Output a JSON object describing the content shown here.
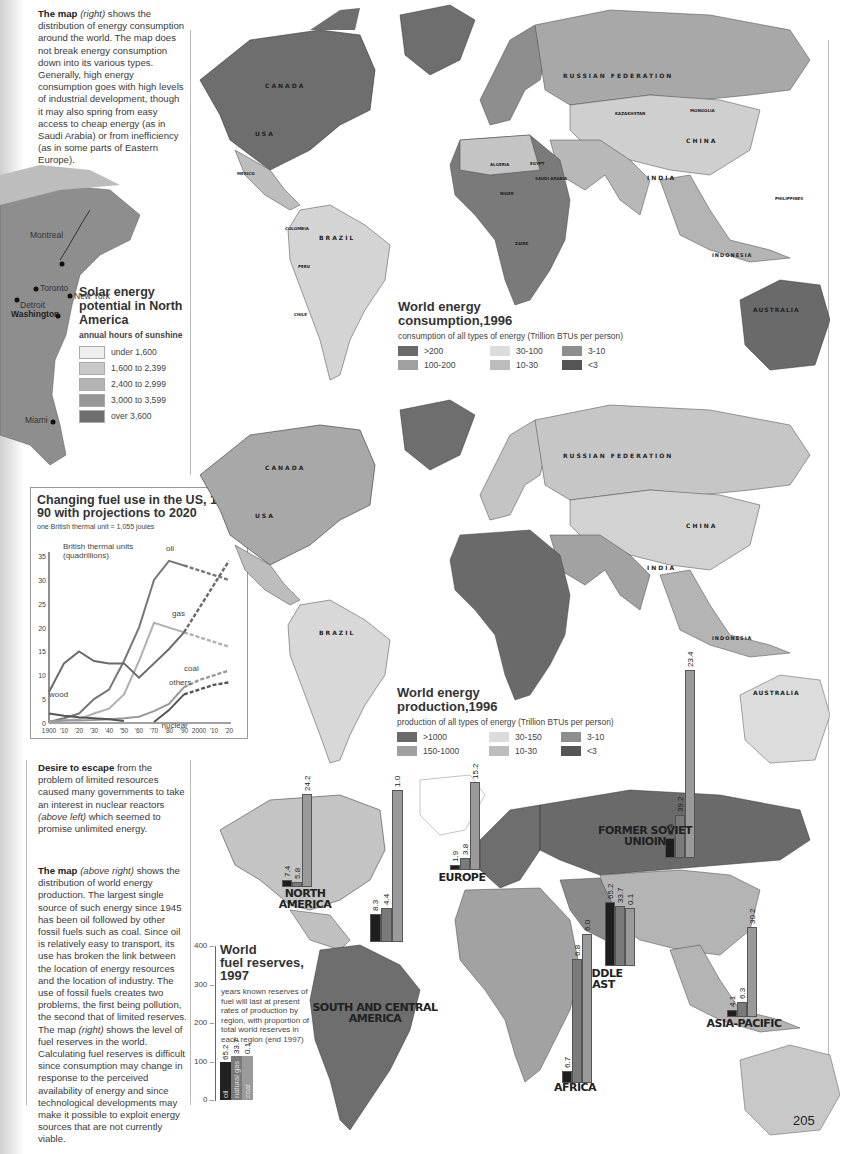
{
  "intro_text": {
    "lead": "The map",
    "lead_italic": "(right)",
    "body": "shows the distribution of energy consumption around the world. The map does not break energy consumption down into its various types. Generally, high energy consumption goes with high levels of industrial development, though it may also spring from easy access to cheap energy (as in Saudi Arabia) or from inefficiency (as in some parts of Eastern Europe)."
  },
  "solar_map": {
    "title": "Solar energy potential in North America",
    "subtitle": "annual hours of sunshine",
    "cities": [
      "Montreal",
      "Toronto",
      "New York",
      "Detroit",
      "Washington",
      "Miami"
    ],
    "legend": [
      {
        "label": "under 1,600",
        "color": "#eeeeee"
      },
      {
        "label": "1,600 to 2,399",
        "color": "#c8c8c8"
      },
      {
        "label": "2,400 to 2,999",
        "color": "#b4b4b4"
      },
      {
        "label": "3,000 to 3,599",
        "color": "#969696"
      },
      {
        "label": "over 3,600",
        "color": "#6e6e6e"
      }
    ]
  },
  "consumption_map": {
    "title_line1": "World energy",
    "title_line2": "consumption,1996",
    "subtitle": "consumption of all types of energy (Trillion BTUs per person)",
    "legend": [
      {
        "label": ">200",
        "color": "#6a6a6a"
      },
      {
        "label": "100-200",
        "color": "#a0a0a0"
      },
      {
        "label": "30-100",
        "color": "#dcdcdc"
      },
      {
        "label": "10-30",
        "color": "#bdbdbd"
      },
      {
        "label": "3-10",
        "color": "#8e8e8e"
      },
      {
        "label": "<3",
        "color": "#555555"
      }
    ],
    "country_labels": [
      "CANADA",
      "USA",
      "MEXICO",
      "VENEZUELA",
      "COLOMBIA",
      "PERU",
      "BRAZIL",
      "BOLIVIA",
      "PARAGUAY",
      "CHILE",
      "ARGENTINA",
      "RUSSIAN FEDERATION",
      "KAZAKHSTAN",
      "MONGOLIA",
      "CHINA",
      "FRANCE",
      "SPAIN",
      "TURKEY",
      "IRAN",
      "INDIA",
      "ALGERIA",
      "LIBYA",
      "EGYPT",
      "SAUDI ARABIA",
      "MALI",
      "NIGER",
      "CHAD",
      "SUDAN",
      "ETHIOPIA",
      "SOMALIA",
      "C.A.R.",
      "ZAIRE",
      "TANZANIA",
      "NAMIBIA",
      "SOUTH AFRICA",
      "PHILIPPINES",
      "MALAYSIA",
      "INDONESIA",
      "AUSTRALIA"
    ]
  },
  "fuel_chart": {
    "title": "Changing fuel use in the US, 1900-90 with projections to 2020",
    "subtitle": "one British thermal unit = 1,055 joules"
  },
  "chart_data": {
    "type": "line",
    "title": "Changing fuel use in the US, 1900-90 with projections to 2020",
    "subtitle": "one British thermal unit = 1,055 joules",
    "ylabel": "British thermal units (quadrillions)",
    "xlabel": "",
    "ylim": [
      0,
      35
    ],
    "yticks": [
      0,
      5,
      10,
      15,
      20,
      25,
      30,
      35
    ],
    "xticks": [
      "1900",
      "'10",
      "'20",
      "'30",
      "'40",
      "'50",
      "'60",
      "'70",
      "'80",
      "'90",
      "2000",
      "'10",
      "'20"
    ],
    "x": [
      1900,
      1910,
      1920,
      1930,
      1940,
      1950,
      1960,
      1970,
      1980,
      1990,
      2000,
      2010,
      2020
    ],
    "projection_start": 1990,
    "series": [
      {
        "name": "oil",
        "values": [
          0.2,
          1,
          2,
          5,
          7,
          13,
          20,
          30,
          34,
          33,
          32,
          31,
          30
        ]
      },
      {
        "name": "gas",
        "values": [
          0.2,
          0.5,
          0.8,
          2,
          3,
          6,
          13,
          21,
          20,
          19,
          18,
          17,
          16
        ]
      },
      {
        "name": "coal",
        "values": [
          6.5,
          12.5,
          15,
          13,
          12.5,
          12.5,
          9.5,
          12.5,
          15.5,
          19,
          24,
          29,
          34
        ]
      },
      {
        "name": "others",
        "values": [
          0.3,
          0.5,
          0.5,
          0.6,
          0.8,
          1,
          1.3,
          2.5,
          4,
          7.5,
          9,
          10,
          11
        ]
      },
      {
        "name": "wood",
        "values": [
          2,
          1.5,
          1.2,
          1,
          0.8,
          0.4,
          null,
          null,
          null,
          null,
          null,
          null,
          null
        ]
      },
      {
        "name": "nuclear",
        "values": [
          null,
          null,
          null,
          null,
          null,
          null,
          null,
          0.2,
          2.7,
          6,
          7,
          8,
          8.5
        ]
      }
    ],
    "grid": false,
    "legend": "inline labels"
  },
  "production_map": {
    "title_line1": "World energy",
    "title_line2": "production,1996",
    "subtitle": "production of all types of energy (Trillion BTUs per person)",
    "legend": [
      {
        "label": ">1000",
        "color": "#6a6a6a"
      },
      {
        "label": "150-1000",
        "color": "#a0a0a0"
      },
      {
        "label": "30-150",
        "color": "#dcdcdc"
      },
      {
        "label": "10-30",
        "color": "#bdbdbd"
      },
      {
        "label": "3-10",
        "color": "#8e8e8e"
      },
      {
        "label": "<3",
        "color": "#555555"
      }
    ]
  },
  "desire_text": {
    "lead": "Desire to escape",
    "body_before": "from the problem of limited resources caused many governments to take an interest in nuclear reactors",
    "italic": "(above left)",
    "body_after": "which seemed to promise unlimited energy."
  },
  "production_text": {
    "lead": "The map",
    "lead_italic": "(above right)",
    "body1": "shows the distribution of world energy production. The largest single source of such energy since 1945 has been oil followed by other fossil fuels such as coal. Since oil is relatively easy to transport, its use has broken the link between the location of energy resources and the location of industry. The use of fossil fuels creates two problems, the first being pollution, the second that of limited reserves. The map",
    "italic2": "(right)",
    "body2": "shows the level of fuel reserves in the world. Calculating fuel reserves is difficult since consumption may change in response to the perceived availability of energy and since technological developments may make it possible to exploit energy sources that are not currently viable."
  },
  "reserves_map": {
    "title_line1": "World",
    "title_line2": "fuel reserves,",
    "title_line3": "1997",
    "subtitle": "years known reserves of fuel will last at present rates of production by region, with proportion of total world reserves in each region (end 1997)",
    "axis_ticks": [
      "400",
      "300",
      "200",
      "100",
      "0"
    ],
    "key_bars": [
      {
        "fuel": "oil",
        "value": "65.2",
        "color": "#222222"
      },
      {
        "fuel": "natural gas",
        "value": "33.7",
        "color": "#7a7a7a"
      },
      {
        "fuel": "coal",
        "value": "0.1",
        "color": "#9a9a9a"
      }
    ],
    "regions": [
      {
        "name": "NORTH AMERICA",
        "oil": "7.4",
        "gas": "5.8",
        "coal": "24.2"
      },
      {
        "name": "SOUTH AND CENTRAL AMERICA",
        "oil": "8.3",
        "gas": "4.4",
        "coal": "1.0"
      },
      {
        "name": "EUROPE",
        "oil": "1.9",
        "gas": "3.8",
        "coal": "15.2"
      },
      {
        "name": "FORMER SOVIET UNIOIN",
        "oil": "6.4",
        "gas": "39.2",
        "coal": "23.4"
      },
      {
        "name": "MIDDLE EAST",
        "oil": "65.2",
        "gas": "33.7",
        "coal": "0.1"
      },
      {
        "name": "AFRICA",
        "oil": "6.7",
        "gas": "6.8",
        "coal": "6.0"
      },
      {
        "name": "ASIA-PACIFIC",
        "oil": "4.1",
        "gas": "6.3",
        "coal": "30.2"
      }
    ]
  },
  "page_number": "205"
}
